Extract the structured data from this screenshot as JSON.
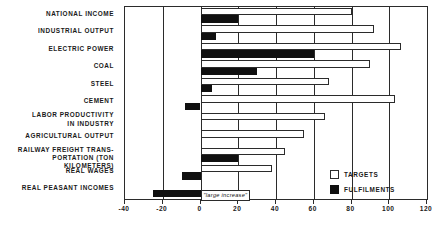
{
  "chart_data": {
    "type": "bar",
    "orientation": "horizontal",
    "title": "",
    "subtitle": "",
    "xlabel": "",
    "ylabel": "",
    "xlim": [
      -40,
      120
    ],
    "xticks": [
      -40,
      -20,
      0,
      20,
      40,
      60,
      80,
      100,
      120
    ],
    "xtick_labels": [
      "-40",
      "-20",
      "0",
      "20",
      "40",
      "60",
      "80",
      "100",
      "120"
    ],
    "grid": true,
    "grid_axis": "x",
    "legend": [
      "TARGETS",
      "FULFILMENTS"
    ],
    "legend_position": "bottom-right",
    "categories": [
      "NATIONAL INCOME",
      "INDUSTRIAL OUTPUT",
      "ELECTRIC POWER",
      "COAL",
      "STEEL",
      "CEMENT",
      "LABOR PRODUCTIVITY\nIN INDUSTRY",
      "AGRICULTURAL OUTPUT",
      "RAILWAY FREIGHT TRANS-\nPORTATION (TON KILOMETERS)",
      "REAL WAGES",
      "REAL PEASANT INCOMES"
    ],
    "series": [
      {
        "name": "TARGETS",
        "color": "#ffffff",
        "values": [
          80,
          92,
          106,
          90,
          68,
          103,
          66,
          55,
          45,
          38,
          null
        ]
      },
      {
        "name": "FULFILMENTS",
        "color": "#101010",
        "values": [
          20,
          8,
          60,
          30,
          6,
          -8,
          0,
          0,
          20,
          -10,
          -25
        ]
      }
    ],
    "annotations": [
      {
        "text": "\"large increase\"",
        "category": "REAL PEASANT INCOMES",
        "series": "TARGETS",
        "x_start": 0,
        "x_end": 42
      }
    ]
  },
  "legend": {
    "targets_label": "TARGETS",
    "fulfilments_label": "FULFILMENTS"
  }
}
